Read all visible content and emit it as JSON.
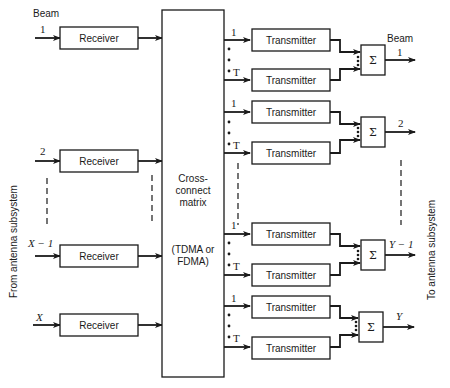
{
  "diagram": {
    "left_side_label": "From antenna subsystem",
    "right_side_label": "To antenna subsystem",
    "input_header": "Beam",
    "output_header": "Beam",
    "receivers": [
      {
        "beam": "1",
        "label": "Receiver"
      },
      {
        "beam": "2",
        "label": "Receiver"
      },
      {
        "beam": "X − 1",
        "label": "Receiver"
      },
      {
        "beam": "X",
        "label": "Receiver"
      }
    ],
    "matrix": {
      "title_line1": "Cross-",
      "title_line2": "connect",
      "title_line3": "matrix",
      "mode_line1": "(TDMA or",
      "mode_line2": "FDMA)"
    },
    "output_groups": [
      {
        "beam": "1",
        "transmitters": [
          {
            "index": "1",
            "label": "Transmitter"
          },
          {
            "index": "T",
            "label": "Transmitter"
          }
        ],
        "combiner": "Σ"
      },
      {
        "beam": "2",
        "transmitters": [
          {
            "index": "1",
            "label": "Transmitter"
          },
          {
            "index": "T",
            "label": "Transmitter"
          }
        ],
        "combiner": "Σ"
      },
      {
        "beam": "Y − 1",
        "transmitters": [
          {
            "index": "1",
            "label": "Transmitter"
          },
          {
            "index": "T",
            "label": "Transmitter"
          }
        ],
        "combiner": "Σ"
      },
      {
        "beam": "Y",
        "transmitters": [
          {
            "index": "1",
            "label": "Transmitter"
          },
          {
            "index": "T",
            "label": "Transmitter"
          }
        ],
        "combiner": "Σ"
      }
    ]
  }
}
